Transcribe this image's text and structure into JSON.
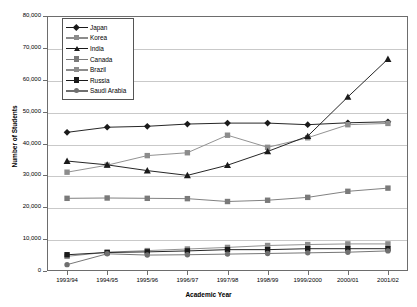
{
  "chart_data": {
    "type": "line",
    "title": "",
    "xlabel": "Academic Year",
    "ylabel": "Number of Students",
    "categories": [
      "1993/94",
      "1994/95",
      "1995/96",
      "1996/97",
      "1997/98",
      "1998/99",
      "1999/2000",
      "2000/01",
      "2001/02"
    ],
    "ylim": [
      0,
      80000
    ],
    "ytick_labels": [
      "0",
      "10,000",
      "20,000",
      "30,000",
      "40,000",
      "50,000",
      "60,000",
      "70,000",
      "80,000"
    ],
    "ytick_values": [
      0,
      10000,
      20000,
      30000,
      40000,
      50000,
      60000,
      70000,
      80000
    ],
    "grid": true,
    "legend_position": "top-left-inside",
    "series": [
      {
        "name": "Japan",
        "marker": "diamond",
        "color": "#1a1a1a",
        "values": [
          43500,
          45100,
          45400,
          46100,
          46400,
          46400,
          45900,
          46500,
          46800
        ]
      },
      {
        "name": "Korea",
        "marker": "square",
        "color": "#8c8c8c",
        "values": [
          31000,
          33200,
          36200,
          37100,
          42600,
          38800,
          41800,
          45900,
          46300
        ]
      },
      {
        "name": "India",
        "marker": "triangle",
        "color": "#1a1a1a",
        "values": [
          34500,
          33300,
          31500,
          30000,
          33200,
          37500,
          42300,
          54600,
          66500
        ]
      },
      {
        "name": "Canada",
        "marker": "square",
        "color": "#7a7a7a",
        "values": [
          22800,
          22900,
          22800,
          22700,
          21800,
          22200,
          23100,
          25000,
          26000
        ]
      },
      {
        "name": "Brazil",
        "marker": "square",
        "color": "#8c8c8c",
        "values": [
          4600,
          5900,
          6400,
          6900,
          7400,
          8000,
          8300,
          8500,
          8500
        ]
      },
      {
        "name": "Russia",
        "marker": "square",
        "color": "#1a1a1a",
        "values": [
          5100,
          5800,
          6000,
          6300,
          6700,
          6700,
          7000,
          7000,
          7000
        ]
      },
      {
        "name": "Saudi Arabia",
        "marker": "circle",
        "color": "#6f6f6f",
        "values": [
          2000,
          5400,
          5000,
          5100,
          5300,
          5500,
          5700,
          5900,
          6300
        ]
      }
    ]
  }
}
